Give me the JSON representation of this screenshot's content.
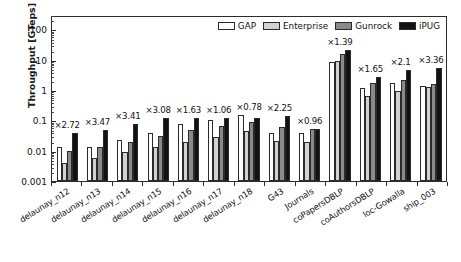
{
  "chart_data": {
    "type": "bar",
    "title": "",
    "xlabel": "",
    "ylabel": "Throughput [GTeps]",
    "yscale": "log",
    "ylim": [
      0.001,
      300
    ],
    "yticks": [
      0.001,
      0.01,
      0.1,
      1,
      10,
      100
    ],
    "ytick_labels": [
      "0.001",
      "0.01",
      "0.1",
      "1",
      "10",
      "100"
    ],
    "grid": false,
    "legend_position": "top-right",
    "categories": [
      "delaunay_n12",
      "delaunay_n13",
      "delaunay_n14",
      "delaunay_n15",
      "delaunay_n16",
      "delaunay_n17",
      "delaunay_n18",
      "G43",
      "Journals",
      "coPapersDBLP",
      "coAuthorsDBLP",
      "loc-Gowalla",
      "ship_003"
    ],
    "series": [
      {
        "name": "GAP",
        "color": "#ffffff",
        "values": [
          0.013,
          0.013,
          0.022,
          0.038,
          0.075,
          0.105,
          0.155,
          0.038,
          0.037,
          8.6,
          1.2,
          1.75,
          1.35
        ]
      },
      {
        "name": "Enterprise",
        "color": "#d2d2d2",
        "values": [
          0.0039,
          0.0057,
          0.0092,
          0.013,
          0.019,
          0.029,
          0.044,
          0.021,
          0.019,
          9.0,
          0.63,
          0.9,
          1.3
        ]
      },
      {
        "name": "Gunrock",
        "color": "#8a8a8a",
        "values": [
          0.0098,
          0.0135,
          0.02,
          0.031,
          0.047,
          0.065,
          0.087,
          0.059,
          0.052,
          15.5,
          1.7,
          2.2,
          1.6
        ]
      },
      {
        "name": "iPUG",
        "color": "#121212",
        "values": [
          0.037,
          0.049,
          0.077,
          0.122,
          0.122,
          0.117,
          0.122,
          0.135,
          0.051,
          21.5,
          2.8,
          4.5,
          5.2
        ]
      }
    ],
    "annotations": [
      "×2.72",
      "×3.47",
      "×3.41",
      "×3.08",
      "×1.63",
      "×1.06",
      "×0.78",
      "×2.25",
      "×0.96",
      "×1.39",
      "×1.65",
      "×2.1",
      "×3.36"
    ]
  },
  "legend": {
    "items": [
      {
        "label": "GAP",
        "swatch": "gap"
      },
      {
        "label": "Enterprise",
        "swatch": "ent"
      },
      {
        "label": "Gunrock",
        "swatch": "gun"
      },
      {
        "label": "iPUG",
        "swatch": "ipu"
      }
    ]
  }
}
